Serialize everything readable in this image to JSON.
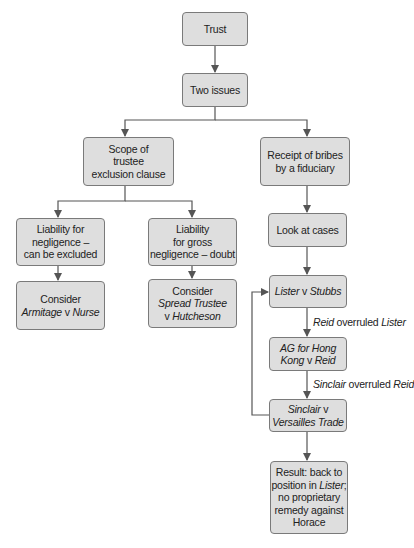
{
  "nodes": {
    "trust": {
      "label": "Trust"
    },
    "two_issues": {
      "label": "Two issues"
    },
    "scope": {
      "l1": "Scope of",
      "l2": "trustee",
      "l3": "exclusion clause"
    },
    "receipt": {
      "l1": "Receipt of bribes",
      "l2": "by a fiduciary"
    },
    "liability_negligence": {
      "l1": "Liability for",
      "l2": "negligence –",
      "l3": "can be excluded"
    },
    "liability_gross": {
      "l1": "Liability",
      "l2": "for gross",
      "l3": "negligence – doubt"
    },
    "consider_armitage": {
      "l1": "Consider",
      "case_a": "Armitage",
      "v": " v ",
      "case_b": "Nurse"
    },
    "consider_spread": {
      "l1": "Consider",
      "case_a": "Spread Trustee",
      "v": "v ",
      "case_b": "Hutcheson"
    },
    "look_at_cases": {
      "label": "Look at cases"
    },
    "lister": {
      "case_a": "Lister",
      "v": " v ",
      "case_b": "Stubbs"
    },
    "ag_reid": {
      "l1": "AG for Hong",
      "l2a": "Kong",
      "v": " v ",
      "l2b": "Reid"
    },
    "sinclair": {
      "case_a": "Sinclair",
      "v": " v",
      "l2": "Versailles Trade"
    },
    "result": {
      "l1": "Result: back to",
      "l2a": "position in ",
      "l2b": "Lister",
      "l2c": ";",
      "l3": "no proprietary",
      "l4": "remedy against",
      "l5": "Horace"
    }
  },
  "edge_labels": {
    "reid_overruled": {
      "a": "Reid",
      "b": " overruled ",
      "c": "Lister"
    },
    "sinclair_overruled": {
      "a": "Sinclair",
      "b": " overruled ",
      "c": "Reid"
    }
  },
  "colors": {
    "box_fill": "#dedede",
    "box_border": "#7a7a7a",
    "line": "#555555",
    "text": "#222222"
  }
}
